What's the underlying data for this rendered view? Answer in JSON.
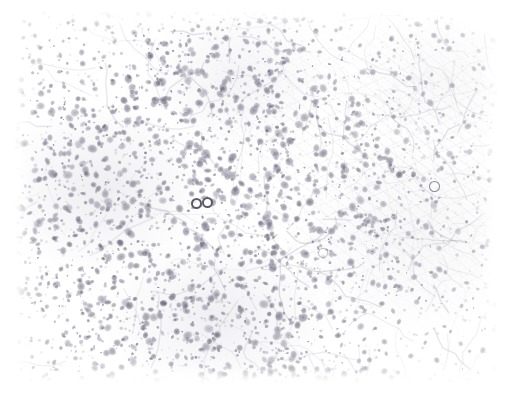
{
  "image": {
    "kind": "histopathology-micrograph",
    "title": "Histopathology micrograph",
    "description": "Light microscopy field of an immunostained tissue section showing densely packed pale violet-grey nuclei on a white background, with fibrous stromal strands across the right half and several individually highlighted cells.",
    "stain_appearance": "pale violet-grey nuclei on white background",
    "background_color": "#ffffff",
    "nucleus_color": "#8d8aa2",
    "nucleus_color_dark": "#5d5a72",
    "stroma_color": "#9a97ad",
    "marker_color": "#46424f",
    "canvas": {
      "width": 511,
      "height": 400
    },
    "field": {
      "left": 14,
      "top": 10,
      "width": 484,
      "height": 373
    },
    "margins": {
      "left": 14,
      "top": 10,
      "right": 13,
      "bottom": 17
    }
  },
  "regions": [
    {
      "name": "dense-nuclei-left",
      "label": "dense nuclear cluster, left-mid field",
      "cx": 0.18,
      "cy": 0.48,
      "density": "high"
    },
    {
      "name": "dense-nuclei-bottom",
      "label": "dense nuclear band, lower field",
      "cx": 0.42,
      "cy": 0.82,
      "density": "high"
    },
    {
      "name": "moderate-nuclei-top",
      "label": "moderate nuclei, upper-mid field",
      "cx": 0.46,
      "cy": 0.18,
      "density": "medium"
    },
    {
      "name": "fibrous-stroma-right",
      "label": "fibrous stromal strands, right field",
      "cx": 0.82,
      "cy": 0.42,
      "density": "low"
    },
    {
      "name": "pale-zone-center",
      "label": "pale acellular zone, centre field",
      "cx": 0.62,
      "cy": 0.52,
      "density": "low"
    }
  ],
  "markers": [
    {
      "name": "marked-cell-1",
      "label": "highlighted cell 1",
      "x": 196,
      "y": 203,
      "d": 11,
      "emphasis": "strong"
    },
    {
      "name": "marked-cell-2",
      "label": "highlighted cell 2",
      "x": 207,
      "y": 202,
      "d": 11,
      "emphasis": "strong"
    },
    {
      "name": "marked-cell-3",
      "label": "highlighted cell 3",
      "x": 434,
      "y": 186,
      "d": 11,
      "emphasis": "medium"
    },
    {
      "name": "marked-cell-4",
      "label": "highlighted cell 4",
      "x": 323,
      "y": 253,
      "d": 10,
      "emphasis": "faint"
    }
  ],
  "nuclei_field": {
    "seed": 20240517,
    "count": 2300,
    "min_radius": 1.2,
    "max_radius": 4.6,
    "base_opacity": 0.3,
    "max_opacity": 0.78
  }
}
